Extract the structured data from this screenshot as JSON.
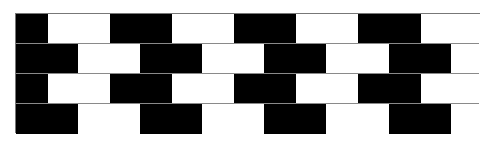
{
  "figure": {
    "name": "cafe-wall-pattern",
    "colors": {
      "dark": "#000000",
      "light": "#ffffff",
      "mortar": "#8a8a8a"
    },
    "rows": [
      {
        "tiles": [
          [
            "dark",
            0,
            32
          ],
          [
            "light",
            32,
            94
          ],
          [
            "dark",
            94,
            156
          ],
          [
            "light",
            156,
            218
          ],
          [
            "dark",
            218,
            280
          ],
          [
            "light",
            280,
            342
          ],
          [
            "dark",
            342,
            405
          ],
          [
            "light",
            405,
            465
          ]
        ]
      },
      {
        "tiles": [
          [
            "dark",
            0,
            62
          ],
          [
            "light",
            62,
            124
          ],
          [
            "dark",
            124,
            186
          ],
          [
            "light",
            186,
            248
          ],
          [
            "dark",
            248,
            310
          ],
          [
            "light",
            310,
            373
          ],
          [
            "dark",
            373,
            435
          ],
          [
            "light",
            435,
            465
          ]
        ]
      },
      {
        "tiles": [
          [
            "dark",
            0,
            32
          ],
          [
            "light",
            32,
            94
          ],
          [
            "dark",
            94,
            156
          ],
          [
            "light",
            156,
            218
          ],
          [
            "dark",
            218,
            280
          ],
          [
            "light",
            280,
            342
          ],
          [
            "dark",
            342,
            405
          ],
          [
            "light",
            405,
            465
          ]
        ]
      },
      {
        "tiles": [
          [
            "dark",
            0,
            62
          ],
          [
            "light",
            62,
            124
          ],
          [
            "dark",
            124,
            186
          ],
          [
            "light",
            186,
            248
          ],
          [
            "dark",
            248,
            310
          ],
          [
            "light",
            310,
            373
          ],
          [
            "dark",
            373,
            435
          ],
          [
            "light",
            435,
            465
          ]
        ]
      }
    ]
  }
}
